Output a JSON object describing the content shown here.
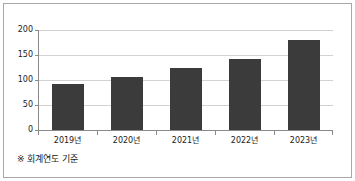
{
  "figure": {
    "background_color": "#ffffff",
    "frame_color": "#a8a8a8",
    "footnote": "※ 회계연도 기준"
  },
  "chart_data": {
    "type": "bar",
    "title": "",
    "subtitle": "",
    "xlabel": "",
    "ylabel": "",
    "categories": [
      "2019년",
      "2020년",
      "2021년",
      "2022년",
      "2023년"
    ],
    "values": [
      93,
      107,
      125,
      143,
      180
    ],
    "series": [
      {
        "name": "",
        "values": [
          93,
          107,
          125,
          143,
          180
        ],
        "color": "#3b3b3b"
      }
    ],
    "ylim": [
      0,
      200
    ],
    "yticks": [
      0,
      50,
      100,
      150,
      200
    ],
    "ytick_labels": [
      "0",
      "50",
      "100",
      "150",
      "200"
    ],
    "grid": true,
    "grid_axis": "y",
    "grid_color": "#d2d2d2",
    "axis_color": "#8a8a8a",
    "legend": false,
    "legend_position": "none",
    "bar_color": "#3b3b3b",
    "annotations": [
      "※ 회계연도 기준"
    ]
  }
}
